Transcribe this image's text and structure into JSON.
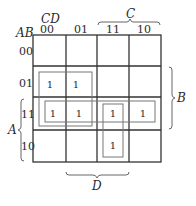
{
  "kmap": {
    "row_var_label": "AB",
    "col_var_label": "CD",
    "col_headers": [
      "00",
      "01",
      "11",
      "10"
    ],
    "row_headers": [
      "00",
      "01",
      "11",
      "10"
    ],
    "cells": [
      [
        "",
        "",
        "",
        ""
      ],
      [
        "1",
        "1",
        "",
        ""
      ],
      [
        "1",
        "1",
        "1",
        "1"
      ],
      [
        "",
        "",
        "1",
        ""
      ]
    ],
    "groups": [
      {
        "name": "B-not-C",
        "cells": "rows 01,11 × cols 00,01"
      },
      {
        "name": "AB",
        "cells": "row 11 × all cols"
      },
      {
        "name": "ACD",
        "cells": "rows 11,10 × col 11"
      }
    ],
    "brackets": {
      "top": "C",
      "right": "B",
      "left": "A",
      "bottom": "D"
    },
    "colors": {
      "grid": "#333333",
      "loop": "#777777",
      "text": "#2a2a2a"
    }
  }
}
